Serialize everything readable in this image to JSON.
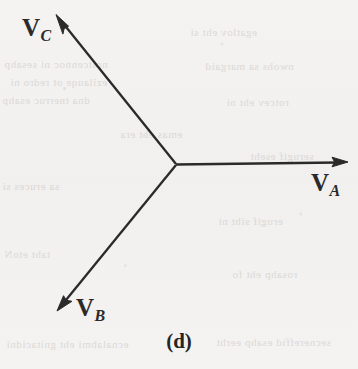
{
  "figure": {
    "caption": "(d)",
    "background_color": "#f3f2f0",
    "stroke_color": "#2b2a2a",
    "origin": {
      "x": 176,
      "y": 164
    }
  },
  "phasors": [
    {
      "name": "V_A",
      "label_base": "V",
      "label_sub": "A",
      "tip": {
        "x": 347,
        "y": 162
      },
      "angle_deg": 0
    },
    {
      "name": "V_B",
      "label_base": "V",
      "label_sub": "B",
      "tip": {
        "x": 58,
        "y": 308
      },
      "angle_deg": -120
    },
    {
      "name": "V_C",
      "label_base": "V",
      "label_sub": "C",
      "tip": {
        "x": 57,
        "y": 18
      },
      "angle_deg": 120
    }
  ],
  "bleedthrough": {
    "lines": [
      "noitcennoc ni sesahp",
      "ezilauqe ot redro ni",
      "dna tnerruc esahp",
      "egatlov eht si",
      "nwohs sa margaid",
      "rotcev eht ni",
      "sa eruces si",
      "erugif siht ni",
      "taht etoN",
      "rosahp eht fo",
      "ecnalabmi eht gnitacidni",
      "secnereffid esahp eerht",
      "emas eht era",
      "serugif eseht"
    ]
  }
}
